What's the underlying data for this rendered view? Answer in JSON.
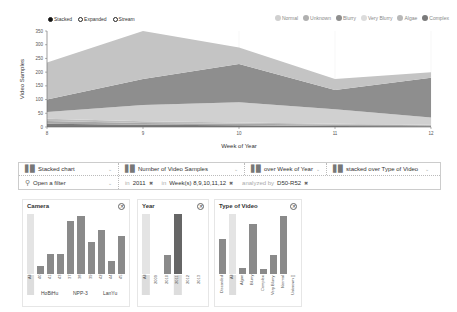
{
  "chart_data": {
    "type": "area",
    "stacked": true,
    "title": "",
    "xlabel": "Week of Year",
    "ylabel": "Video Samples",
    "x": [
      8,
      9,
      10,
      11,
      12
    ],
    "ylim": [
      0,
      350
    ],
    "yticks": [
      0,
      50,
      100,
      150,
      200,
      250,
      300,
      350
    ],
    "series": [
      {
        "name": "Complex",
        "color": "#7a7a7a",
        "values": [
          12,
          8,
          6,
          4,
          3
        ]
      },
      {
        "name": "Algae",
        "color": "#a8a8a8",
        "values": [
          10,
          7,
          6,
          5,
          3
        ]
      },
      {
        "name": "Very Blurry",
        "color": "#bdbdbd",
        "values": [
          8,
          6,
          4,
          3,
          2
        ]
      },
      {
        "name": "Normal",
        "color": "#d0d0d0",
        "values": [
          25,
          59,
          74,
          53,
          27
        ]
      },
      {
        "name": "Blurry",
        "color": "#8e8e8e",
        "values": [
          45,
          95,
          140,
          70,
          145
        ]
      },
      {
        "name": "Unknown",
        "color": "#c4c4c4",
        "values": [
          135,
          175,
          60,
          40,
          20
        ]
      }
    ]
  },
  "chart": {
    "mode_options": [
      {
        "label": "Stacked",
        "selected": true
      },
      {
        "label": "Expanded",
        "selected": false
      },
      {
        "label": "Stream",
        "selected": false
      }
    ],
    "legend": [
      {
        "label": "Normal",
        "color": "#d0d0d0"
      },
      {
        "label": "Unknown",
        "color": "#b0b0b0"
      },
      {
        "label": "Blurry",
        "color": "#8e8e8e"
      },
      {
        "label": "Very Blurry",
        "color": "#dcdcdc"
      },
      {
        "label": "Algae",
        "color": "#b8b8b8"
      },
      {
        "label": "Complex",
        "color": "#7a7a7a"
      }
    ],
    "ytick_labels": [
      "0",
      "50",
      "100",
      "150",
      "200",
      "250",
      "300",
      "350"
    ],
    "xtick_labels": [
      "8",
      "9",
      "10",
      "11",
      "12"
    ],
    "xlabel": "Week of Year",
    "ylabel": "Video Samples"
  },
  "toolbar": {
    "chart_type": "Stacked chart",
    "measure": "Number of Video Samples",
    "x_dim": "over Week of Year",
    "stack_dim": "stacked over Type of Video",
    "filter_placeholder": "Open a filter",
    "filters": [
      {
        "prefix": "in",
        "value": "2011"
      },
      {
        "prefix": "in",
        "value": "Week(s) 8,9,10,11,12"
      },
      {
        "prefix": "analyzed by",
        "value": "D50-R52"
      }
    ]
  },
  "facets": {
    "camera": {
      "title": "Camera",
      "bars": [
        {
          "label": "All",
          "value": 100,
          "kind": "all"
        },
        {
          "label": "40",
          "value": 14
        },
        {
          "label": "41",
          "value": 33
        },
        {
          "label": "43",
          "value": 33
        },
        {
          "label": "37",
          "value": 88
        },
        {
          "label": "38",
          "value": 97
        },
        {
          "label": "39",
          "value": 53
        },
        {
          "label": "42",
          "value": 73
        },
        {
          "label": "44",
          "value": 21
        },
        {
          "label": "45",
          "value": 63
        }
      ],
      "groups": [
        "HoBiHu",
        "NPP-3",
        "LanYu"
      ]
    },
    "year": {
      "title": "Year",
      "bars": [
        {
          "label": "All",
          "value": 0,
          "kind": "all"
        },
        {
          "label": "2009",
          "value": 0
        },
        {
          "label": "2010",
          "value": 32
        },
        {
          "label": "2011",
          "value": 100,
          "kind": "sel"
        },
        {
          "label": "2012",
          "value": 0
        },
        {
          "label": "2013",
          "value": 0
        }
      ]
    },
    "type": {
      "title": "Type of Video",
      "bars": [
        {
          "label": "Discarded",
          "value": 58
        },
        {
          "label": "All",
          "value": 100,
          "kind": "all"
        },
        {
          "label": "Algae",
          "value": 10
        },
        {
          "label": "Blurry",
          "value": 83
        },
        {
          "label": "Complex",
          "value": 8
        },
        {
          "label": "Very Blurry",
          "value": 31
        },
        {
          "label": "Normal",
          "value": 97
        },
        {
          "label": "Unknown []",
          "value": 0
        }
      ]
    }
  }
}
